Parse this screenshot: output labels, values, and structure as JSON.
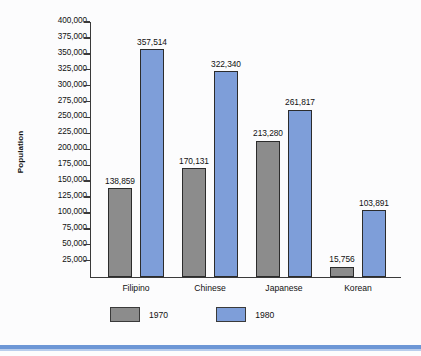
{
  "chart_data": {
    "type": "bar",
    "title": "",
    "xlabel": "",
    "ylabel": "Population",
    "ylim": [
      0,
      400000
    ],
    "ytick_interval": 25000,
    "grid": false,
    "legend_position": "bottom-left",
    "categories": [
      "Filipino",
      "Chinese",
      "Japanese",
      "Korean"
    ],
    "ytick_labels": [
      "400,000",
      "375,000",
      "350,000",
      "325,000",
      "300,000",
      "275,000",
      "250,000",
      "225,000",
      "200,000",
      "175,000",
      "150,000",
      "125,000",
      "100,000",
      "75,000",
      "50,000",
      "25,000"
    ],
    "ytick_values": [
      400000,
      375000,
      350000,
      325000,
      300000,
      275000,
      250000,
      225000,
      200000,
      175000,
      150000,
      125000,
      100000,
      75000,
      50000,
      25000
    ],
    "series": [
      {
        "name": "1970",
        "color": "#8c8c8c",
        "values": [
          138859,
          170131,
          213280,
          15756
        ],
        "labels": [
          "138,859",
          "170,131",
          "213,280",
          "15,756"
        ]
      },
      {
        "name": "1980",
        "color": "#7e9ed9",
        "values": [
          357514,
          322340,
          261817,
          103891
        ],
        "labels": [
          "357,514",
          "322,340",
          "261,817",
          "103,891"
        ]
      }
    ]
  },
  "axis": {
    "y_title": "Population"
  },
  "legend": {
    "entries": [
      {
        "label": "1970",
        "color": "#8c8c8c"
      },
      {
        "label": "1980",
        "color": "#7e9ed9"
      }
    ]
  },
  "colors": {
    "series_1970": "#8c8c8c",
    "series_1980": "#7e9ed9",
    "axis": "#3a3a3a",
    "bar_outline": "#2c2c2c",
    "background": "#fcfcfd",
    "bottom_rule": "#6d97d6"
  }
}
